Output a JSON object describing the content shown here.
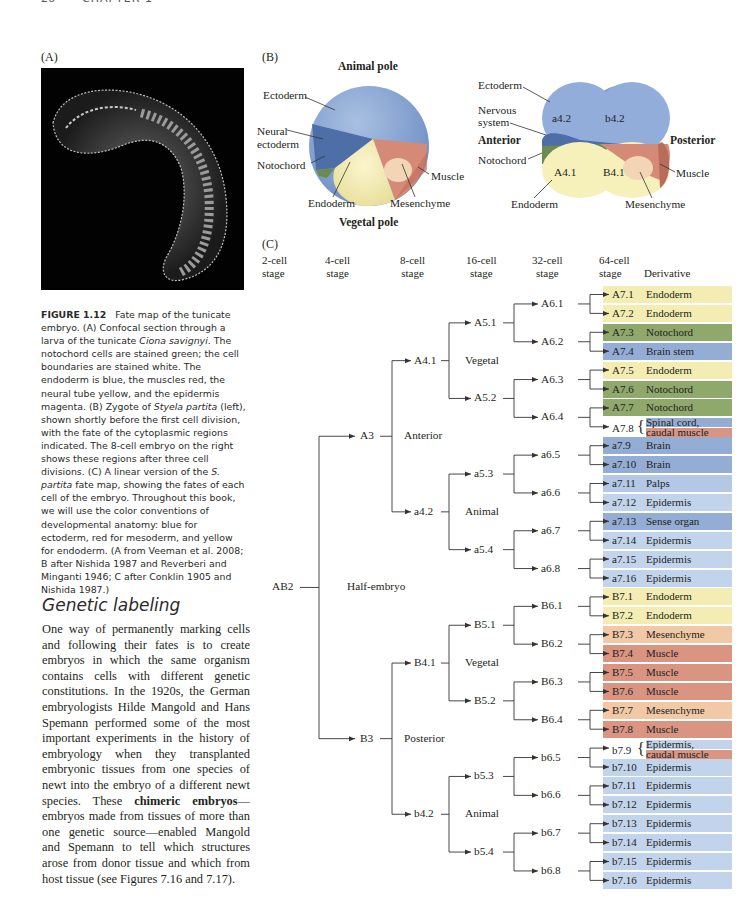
{
  "page": {
    "number": "26",
    "running_head": "CHAPTER 1"
  },
  "panels": {
    "a": "(A)",
    "b": "(B)",
    "c": "(C)"
  },
  "zygote": {
    "animal_pole": "Animal pole",
    "vegetal_pole": "Vegetal pole",
    "labels": {
      "ectoderm": "Ectoderm",
      "neural_ectoderm_1": "Neural",
      "neural_ectoderm_2": "ectoderm",
      "notochord": "Notochord",
      "endoderm": "Endoderm",
      "mesenchyme": "Mesenchyme",
      "muscle": "Muscle"
    }
  },
  "embryo8": {
    "labels": {
      "ectoderm": "Ectoderm",
      "nervous_1": "Nervous",
      "nervous_2": "system",
      "anterior": "Anterior",
      "posterior": "Posterior",
      "notochord": "Notochord",
      "endoderm": "Endoderm",
      "mesenchyme": "Mesenchyme",
      "muscle": "Muscle"
    },
    "cells": {
      "a42": "a4.2",
      "b42": "b4.2",
      "A41": "A4.1",
      "B41": "B4.1"
    }
  },
  "caption": {
    "figure_label": "FIGURE 1.12",
    "text_1": "Fate map of the tunicate embryo. (A) Confocal section through a larva of the tunicate ",
    "species_1": "Ciona savignyi",
    "text_2": ". The notochord cells are stained green; the cell boundaries are stained white. The endoderm is blue, the muscles red, the neural tube yellow, and the epidermis magenta. (B) Zygote of ",
    "species_2": "Styela partita",
    "text_3": " (left), shown shortly before the first cell division, with the fate of the cytoplasmic regions indicated. The 8-cell embryo on the right shows these regions after three cell divisions. (C) A linear version of the ",
    "species_3": "S. partita",
    "text_4": " fate map, showing the fates of each cell of the embryo. Throughout this book, we will use the color conventions of developmental anatomy: blue for ectoderm, red for mesoderm, and yellow for endoderm. (A from Veeman et al. 2008; B after Nishida 1987 and Reverberi and Minganti 1946; C after Conklin 1905 and Nishida 1987.)"
  },
  "section": {
    "heading": "Genetic labeling",
    "text_1": "One way of permanently marking cells and following their fates is to create embryos in which the same organism contains cells with different genetic constitutions. In the 1920s, the German embryologists Hilde Mangold and Hans Spemann performed some of the most important experiments in the history of embryology when they transplanted embryonic tissues from one species of newt into the embryo of a different newt species. These ",
    "bold": "chimeric embryos",
    "text_2": "—embryos made from tissues of more than one genetic source—enabled Mangold and Spemann to tell which structures arose from donor tissue and which from host tissue (see Figures 7.16 and 7.17)."
  },
  "lineage": {
    "stages": [
      "2-cell",
      "4-cell",
      "8-cell",
      "16-cell",
      "32-cell",
      "64-cell"
    ],
    "stage_word": "stage",
    "derivative_header": "Derivative",
    "nodes": {
      "AB2": "AB2",
      "half": "Half-embryo",
      "A3": "A3",
      "B3": "B3",
      "anterior": "Anterior",
      "posterior": "Posterior",
      "A41": "A4.1",
      "a42": "a4.2",
      "B41": "B4.1",
      "b42": "b4.2",
      "vegetal": "Vegetal",
      "animal": "Animal",
      "A51": "A5.1",
      "A52": "A5.2",
      "a53": "a5.3",
      "a54": "a5.4",
      "B51": "B5.1",
      "B52": "B5.2",
      "b53": "b5.3",
      "b54": "b5.4",
      "A61": "A6.1",
      "A62": "A6.2",
      "A63": "A6.3",
      "A64": "A6.4",
      "a65": "a6.5",
      "a66": "a6.6",
      "a67": "a6.7",
      "a68": "a6.8",
      "B61": "B6.1",
      "B62": "B6.2",
      "B63": "B6.3",
      "B64": "B6.4",
      "b65": "b6.5",
      "b66": "b6.6",
      "b67": "b6.7",
      "b68": "b6.8"
    },
    "rows": [
      {
        "cell": "A7.1",
        "derivative": "Endoderm",
        "color": "#f3edb3"
      },
      {
        "cell": "A7.2",
        "derivative": "Endoderm",
        "color": "#f3edb3"
      },
      {
        "cell": "A7.3",
        "derivative": "Notochord",
        "color": "#8fa86b"
      },
      {
        "cell": "A7.4",
        "derivative": "Brain stem",
        "color": "#93add4"
      },
      {
        "cell": "A7.5",
        "derivative": "Endoderm",
        "color": "#f3edb3"
      },
      {
        "cell": "A7.6",
        "derivative": "Notochord",
        "color": "#8fa86b"
      },
      {
        "cell": "A7.7",
        "derivative": "Notochord",
        "color": "#8fa86b"
      },
      {
        "cell": "A7.8",
        "derivative": "Spinal cord,",
        "derivative2": "caudal muscle",
        "color": "#93add4",
        "color2": "#d99482"
      },
      {
        "cell": "a7.9",
        "derivative": "Brain",
        "color": "#93add4"
      },
      {
        "cell": "a7.10",
        "derivative": "Brain",
        "color": "#93add4"
      },
      {
        "cell": "a7.11",
        "derivative": "Palps",
        "color": "#b4c8e6"
      },
      {
        "cell": "a7.12",
        "derivative": "Epidermis",
        "color": "#c2d3ec"
      },
      {
        "cell": "a7.13",
        "derivative": "Sense organ",
        "color": "#93add4"
      },
      {
        "cell": "a7.14",
        "derivative": "Epidermis",
        "color": "#c2d3ec"
      },
      {
        "cell": "a7.15",
        "derivative": "Epidermis",
        "color": "#c2d3ec"
      },
      {
        "cell": "a7.16",
        "derivative": "Epidermis",
        "color": "#c2d3ec"
      },
      {
        "cell": "B7.1",
        "derivative": "Endoderm",
        "color": "#f3edb3"
      },
      {
        "cell": "B7.2",
        "derivative": "Endoderm",
        "color": "#f3edb3"
      },
      {
        "cell": "B7.3",
        "derivative": "Mesenchyme",
        "color": "#f1c9a6"
      },
      {
        "cell": "B7.4",
        "derivative": "Muscle",
        "color": "#d99482"
      },
      {
        "cell": "B7.5",
        "derivative": "Muscle",
        "color": "#d99482"
      },
      {
        "cell": "B7.6",
        "derivative": "Muscle",
        "color": "#d99482"
      },
      {
        "cell": "B7.7",
        "derivative": "Mesenchyme",
        "color": "#f1c9a6"
      },
      {
        "cell": "B7.8",
        "derivative": "Muscle",
        "color": "#d99482"
      },
      {
        "cell": "b7.9",
        "derivative": "Epidermis,",
        "derivative2": "caudal muscle",
        "color": "#c2d3ec",
        "color2": "#d99482"
      },
      {
        "cell": "b7.10",
        "derivative": "Epidermis",
        "color": "#c2d3ec"
      },
      {
        "cell": "b7.11",
        "derivative": "Epidermis",
        "color": "#c2d3ec"
      },
      {
        "cell": "b7.12",
        "derivative": "Epidermis",
        "color": "#c2d3ec"
      },
      {
        "cell": "b7.13",
        "derivative": "Epidermis",
        "color": "#c2d3ec"
      },
      {
        "cell": "b7.14",
        "derivative": "Epidermis",
        "color": "#c2d3ec"
      },
      {
        "cell": "b7.15",
        "derivative": "Epidermis",
        "color": "#c2d3ec"
      },
      {
        "cell": "b7.16",
        "derivative": "Epidermis",
        "color": "#c2d3ec"
      }
    ]
  }
}
